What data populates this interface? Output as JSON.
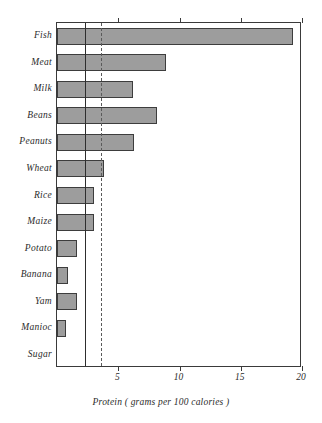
{
  "chart_data": {
    "type": "bar",
    "orientation": "horizontal",
    "title": "",
    "subtitle": "",
    "xlabel": "Protein ( grams per 100 calories )",
    "ylabel": "",
    "xlim": [
      0,
      20
    ],
    "ylim": null,
    "grid": false,
    "legend": null,
    "xticks": [
      5,
      10,
      15,
      20
    ],
    "xtick_labels": [
      "5",
      "10",
      "15",
      "20"
    ],
    "categories": [
      "Fish",
      "Meat",
      "Milk",
      "Beans",
      "Peanuts",
      "Wheat",
      "Rice",
      "Maize",
      "Potato",
      "Banana",
      "Yam",
      "Manioc",
      "Sugar"
    ],
    "values": [
      19.3,
      8.9,
      6.2,
      8.2,
      6.3,
      3.8,
      3.0,
      3.0,
      1.6,
      0.9,
      1.6,
      0.7,
      0.0
    ],
    "annotations": [
      {
        "name": "reference-line-solid",
        "x": 2.3,
        "style": "solid"
      },
      {
        "name": "reference-line-dashed",
        "x": 3.6,
        "style": "dashed"
      }
    ],
    "bar_color": "#9d9d9d",
    "bar_edge_color": "#3d3d3d",
    "axis_color": "#3a3a3a"
  },
  "caption": {
    "text": "Protein ( grams per 100 calories )"
  }
}
